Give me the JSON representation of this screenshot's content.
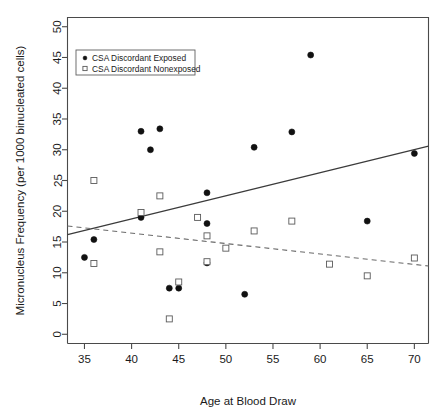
{
  "chart_data": {
    "type": "scatter",
    "title": "",
    "xlabel": "Age at Blood Draw",
    "ylabel": "Micronucleus Frequency (per 1000 binucleated cells)",
    "xlim": [
      33.2,
      71.5
    ],
    "ylim": [
      -1.5,
      51.5
    ],
    "xticks": [
      35,
      40,
      45,
      50,
      55,
      60,
      65,
      70
    ],
    "yticks": [
      0,
      5,
      10,
      15,
      20,
      25,
      30,
      35,
      40,
      45,
      50
    ],
    "grid": false,
    "legend_position": "top-left",
    "legend": [
      {
        "label": "CSA Discordant Exposed",
        "marker": "filled-circle"
      },
      {
        "label": "CSA Discordant Nonexposed",
        "marker": "open-square"
      }
    ],
    "series": [
      {
        "name": "CSA Discordant Exposed",
        "marker": "filled-circle",
        "points": [
          {
            "x": 35.0,
            "y": 12.5
          },
          {
            "x": 36.0,
            "y": 15.4
          },
          {
            "x": 41.0,
            "y": 33.0
          },
          {
            "x": 41.0,
            "y": 19.0
          },
          {
            "x": 42.0,
            "y": 30.0
          },
          {
            "x": 43.0,
            "y": 33.4
          },
          {
            "x": 44.0,
            "y": 7.5
          },
          {
            "x": 45.0,
            "y": 7.5
          },
          {
            "x": 48.0,
            "y": 23.0
          },
          {
            "x": 48.0,
            "y": 18.0
          },
          {
            "x": 48.0,
            "y": 11.6
          },
          {
            "x": 52.0,
            "y": 6.5
          },
          {
            "x": 53.0,
            "y": 30.4
          },
          {
            "x": 57.0,
            "y": 32.9
          },
          {
            "x": 59.0,
            "y": 45.4
          },
          {
            "x": 65.0,
            "y": 18.4
          },
          {
            "x": 70.0,
            "y": 29.4
          }
        ]
      },
      {
        "name": "CSA Discordant Nonexposed",
        "marker": "open-square",
        "points": [
          {
            "x": 36.0,
            "y": 25.0
          },
          {
            "x": 36.0,
            "y": 11.5
          },
          {
            "x": 41.0,
            "y": 19.8
          },
          {
            "x": 43.0,
            "y": 22.5
          },
          {
            "x": 43.0,
            "y": 13.4
          },
          {
            "x": 44.0,
            "y": 2.5
          },
          {
            "x": 45.0,
            "y": 8.5
          },
          {
            "x": 47.0,
            "y": 19.0
          },
          {
            "x": 48.0,
            "y": 16.0
          },
          {
            "x": 48.0,
            "y": 11.8
          },
          {
            "x": 50.0,
            "y": 14.0
          },
          {
            "x": 53.0,
            "y": 16.8
          },
          {
            "x": 57.0,
            "y": 18.4
          },
          {
            "x": 61.0,
            "y": 11.4
          },
          {
            "x": 65.0,
            "y": 9.5
          },
          {
            "x": 70.0,
            "y": 12.4
          }
        ]
      }
    ],
    "trendlines": [
      {
        "name": "CSA Discordant Exposed trend",
        "style": "solid",
        "x_start": 33.2,
        "y_start": 16.2,
        "x_end": 71.5,
        "y_end": 30.6
      },
      {
        "name": "CSA Discordant Nonexposed trend",
        "style": "dashed",
        "x_start": 33.2,
        "y_start": 17.6,
        "x_end": 71.5,
        "y_end": 11.1
      }
    ]
  }
}
